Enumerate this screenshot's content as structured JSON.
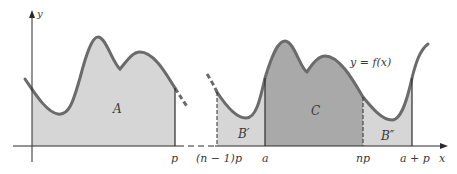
{
  "diagram": {
    "axes": {
      "x_label": "x",
      "y_label": "y"
    },
    "function_label": "y = f(x)",
    "regions": {
      "A": "A",
      "B_prime": "B′",
      "C": "C",
      "B_double_prime": "B″"
    },
    "tick_labels": {
      "p": "p",
      "n_minus_1_p": "(n − 1)p",
      "a": "a",
      "np": "np",
      "a_plus_p": "a + p"
    },
    "colors": {
      "curve": "#6b6b6b",
      "light_fill": "#d6d6d6",
      "dark_fill": "#a9a9a9",
      "axis": "#2a2a2a",
      "background": "#ffffff"
    }
  }
}
